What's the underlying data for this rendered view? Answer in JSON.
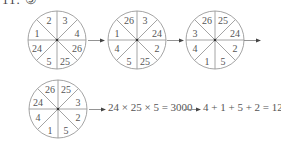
{
  "header": {
    "label": "11. ⑤"
  },
  "wheels": [
    {
      "id": "step-1",
      "sectors": [
        "2",
        "3",
        "4",
        "26",
        "25",
        "5",
        "24",
        "1"
      ]
    },
    {
      "id": "step-2",
      "sectors": [
        "26",
        "3",
        "24",
        "2",
        "25",
        "5",
        "4",
        "1"
      ]
    },
    {
      "id": "step-3",
      "sectors": [
        "26",
        "25",
        "24",
        "2",
        "5",
        "1",
        "4",
        "3"
      ]
    },
    {
      "id": "step-4",
      "sectors": [
        "26",
        "25",
        "3",
        "2",
        "5",
        "1",
        "4",
        "24"
      ]
    }
  ],
  "calculation": {
    "product": "24 × 25 × 5 = 3000",
    "digit_sum": "4 + 1 + 5 + 2 = 12"
  },
  "colors": {
    "lines": "#9a9a9a",
    "text": "#555555",
    "arrowhead": "#444444"
  }
}
